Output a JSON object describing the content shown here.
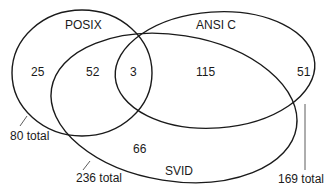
{
  "diagram": {
    "type": "venn",
    "sets": [
      {
        "name": "POSIX",
        "total_label": "80 total"
      },
      {
        "name": "ANSI C",
        "total_label": "169 total"
      },
      {
        "name": "SVID",
        "total_label": "236 total"
      }
    ],
    "regions": {
      "posix_only": "25",
      "posix_svid": "52",
      "posix_ansi_svid": "3",
      "ansi_svid": "115",
      "ansi_only": "51",
      "svid_only": "66"
    }
  }
}
